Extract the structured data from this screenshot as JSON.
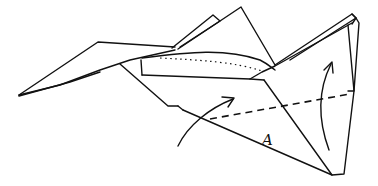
{
  "diagram": {
    "type": "origami folding instruction",
    "labels": [
      {
        "id": "flap-A",
        "text": "A",
        "x": 268,
        "y": 144
      }
    ],
    "annotations": {
      "fold_line": "dashed valley fold line across lower triangle",
      "dotted_line": "dotted hidden-edge line along upper fuselage",
      "arrows": [
        "curved arrow lifting left side upward",
        "curved arrow folding right side upward"
      ]
    },
    "colors": {
      "ink": "#111111",
      "background": "#ffffff"
    }
  }
}
